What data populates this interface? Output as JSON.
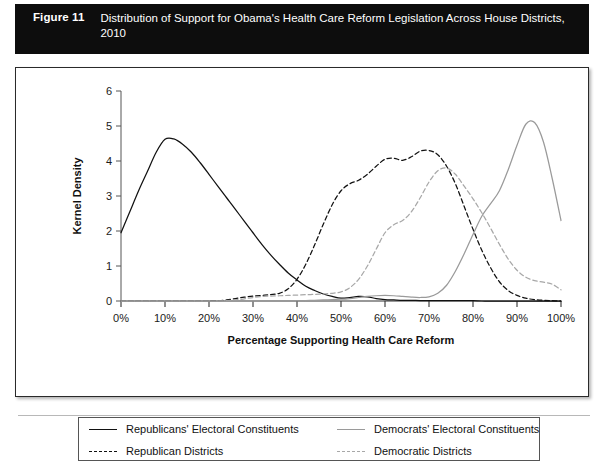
{
  "figure": {
    "number_label": "Figure 11",
    "caption": "Distribution of Support for Obama's Health Care Reform Legislation Across House Districts, 2010"
  },
  "legend": {
    "items": [
      {
        "label": "Republicans' Electoral Constituents",
        "swatch": "solid-black-line-icon",
        "color": "#111111",
        "style": "solid"
      },
      {
        "label": "Democrats' Electoral Constituents",
        "swatch": "solid-gray-line-icon",
        "color": "#9a9a9a",
        "style": "solid"
      },
      {
        "label": "Republican Districts",
        "swatch": "dashed-black-line-icon",
        "color": "#111111",
        "style": "dashed"
      },
      {
        "label": "Democratic Districts",
        "swatch": "dashed-gray-line-icon",
        "color": "#a8a8a8",
        "style": "dashed"
      }
    ]
  },
  "chart_data": {
    "type": "line",
    "title": "",
    "xlabel": "Percentage Supporting Health Care Reform",
    "ylabel": "Kernel Density",
    "xlim": [
      0,
      100
    ],
    "ylim": [
      0,
      6
    ],
    "xticks": [
      0,
      10,
      20,
      30,
      40,
      50,
      60,
      70,
      80,
      90,
      100
    ],
    "xtick_labels": [
      "0%",
      "10%",
      "20%",
      "30%",
      "40%",
      "50%",
      "60%",
      "70%",
      "80%",
      "90%",
      "100%"
    ],
    "yticks": [
      0,
      1,
      2,
      3,
      4,
      5,
      6
    ],
    "ytick_labels": [
      "0",
      "1",
      "2",
      "3",
      "4",
      "5",
      "6"
    ],
    "grid": false,
    "legend_position": "below-plot",
    "x": [
      0,
      2,
      4,
      6,
      8,
      10,
      12,
      14,
      16,
      18,
      20,
      22,
      24,
      26,
      28,
      30,
      32,
      34,
      36,
      38,
      40,
      42,
      44,
      46,
      48,
      50,
      52,
      54,
      56,
      58,
      60,
      62,
      64,
      66,
      68,
      70,
      72,
      74,
      76,
      78,
      80,
      82,
      84,
      86,
      88,
      90,
      92,
      94,
      96,
      98,
      100
    ],
    "series": [
      {
        "name": "Republicans' Electoral Constituents",
        "color": "#111111",
        "style": "solid",
        "peak_x": 10,
        "peak_y": 4.65,
        "values": [
          1.95,
          2.55,
          3.15,
          3.7,
          4.25,
          4.62,
          4.63,
          4.48,
          4.25,
          3.95,
          3.62,
          3.28,
          2.95,
          2.62,
          2.28,
          1.95,
          1.62,
          1.32,
          1.05,
          0.8,
          0.6,
          0.42,
          0.3,
          0.2,
          0.13,
          0.08,
          0.1,
          0.13,
          0.12,
          0.07,
          0.04,
          0.03,
          0.02,
          0.02,
          0.01,
          0.01,
          0.01,
          0.01,
          0.01,
          0.01,
          0.01,
          0.0,
          0.0,
          0.0,
          0.0,
          0.0,
          0.0,
          0.0,
          0.0,
          0.0,
          0.0
        ]
      },
      {
        "name": "Republican Districts",
        "color": "#111111",
        "style": "dashed",
        "peak_x": 49,
        "peak_y": 4.3,
        "values": [
          0.0,
          0.0,
          0.0,
          0.0,
          0.0,
          0.0,
          0.0,
          0.0,
          0.0,
          0.0,
          0.0,
          0.01,
          0.03,
          0.07,
          0.11,
          0.14,
          0.16,
          0.18,
          0.22,
          0.35,
          0.62,
          1.05,
          1.6,
          2.2,
          2.75,
          3.15,
          3.35,
          3.45,
          3.62,
          3.85,
          4.05,
          4.08,
          4.02,
          4.12,
          4.28,
          4.3,
          4.18,
          3.85,
          3.35,
          2.7,
          2.05,
          1.45,
          0.95,
          0.55,
          0.3,
          0.16,
          0.08,
          0.04,
          0.02,
          0.01,
          0.0
        ]
      },
      {
        "name": "Democratic Districts",
        "color": "#a8a8a8",
        "style": "dashed",
        "peak_x": 60,
        "peak_y": 3.8,
        "values": [
          0.0,
          0.0,
          0.0,
          0.0,
          0.0,
          0.0,
          0.0,
          0.0,
          0.0,
          0.0,
          0.0,
          0.0,
          0.01,
          0.03,
          0.06,
          0.1,
          0.13,
          0.14,
          0.15,
          0.16,
          0.17,
          0.18,
          0.19,
          0.2,
          0.22,
          0.26,
          0.38,
          0.62,
          1.0,
          1.48,
          1.95,
          2.18,
          2.3,
          2.55,
          2.95,
          3.4,
          3.72,
          3.8,
          3.62,
          3.28,
          2.92,
          2.52,
          2.08,
          1.62,
          1.2,
          0.88,
          0.68,
          0.58,
          0.54,
          0.48,
          0.32
        ]
      },
      {
        "name": "Democrats' Electoral Constituents",
        "color": "#9a9a9a",
        "style": "solid",
        "peak_x": 92,
        "peak_y": 5.1,
        "values": [
          0.0,
          0.0,
          0.0,
          0.0,
          0.0,
          0.0,
          0.0,
          0.0,
          0.0,
          0.0,
          0.0,
          0.0,
          0.0,
          0.0,
          0.0,
          0.0,
          0.0,
          0.0,
          0.0,
          0.0,
          0.0,
          0.01,
          0.02,
          0.03,
          0.04,
          0.05,
          0.07,
          0.1,
          0.13,
          0.15,
          0.16,
          0.15,
          0.13,
          0.11,
          0.1,
          0.12,
          0.22,
          0.45,
          0.85,
          1.35,
          1.9,
          2.42,
          2.78,
          3.15,
          3.75,
          4.45,
          5.05,
          5.1,
          4.55,
          3.5,
          2.3
        ]
      }
    ]
  }
}
